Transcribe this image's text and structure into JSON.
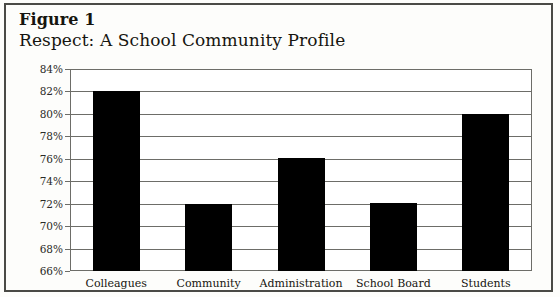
{
  "figure": {
    "label": "Figure 1",
    "title": "Respect: A School Community Profile"
  },
  "chart_data": {
    "type": "bar",
    "title": "Respect: A School Community Profile",
    "categories": [
      "Colleagues",
      "Community",
      "Administration",
      "School Board",
      "Students"
    ],
    "values": [
      82.0,
      72.0,
      76.1,
      72.1,
      80.0
    ],
    "value_labels": [
      "82%",
      "72%",
      "76%",
      "72%",
      "80%"
    ],
    "xlabel": "",
    "ylabel": "",
    "ylim": [
      66,
      84
    ],
    "ytick_step": 2,
    "yticks": [
      84,
      82,
      80,
      78,
      76,
      74,
      72,
      70,
      68,
      66
    ],
    "ytick_labels": [
      "84%",
      "82%",
      "80%",
      "78%",
      "76%",
      "74%",
      "72%",
      "70%",
      "68%",
      "66%"
    ],
    "grid": true,
    "legend": false,
    "bar_color": "#000000",
    "axis_color": "#6d6d68",
    "frame_color": "#4a4a46",
    "background": "#fdfdfb"
  }
}
